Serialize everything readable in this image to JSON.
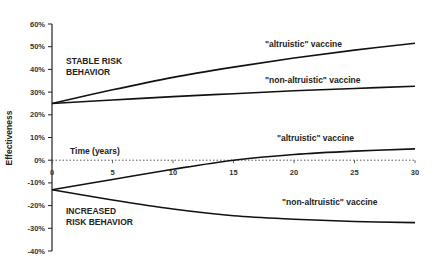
{
  "chart_data": {
    "type": "line",
    "title": "",
    "xlabel": "Time (years)",
    "ylabel": "Effectiveness",
    "xlim": [
      0,
      30
    ],
    "ylim": [
      -40,
      60
    ],
    "x_ticks": [
      "0",
      "5",
      "10",
      "15",
      "20",
      "25",
      "30"
    ],
    "y_ticks": [
      "60%",
      "50%",
      "40%",
      "30%",
      "20%",
      "10%",
      "0%",
      "-10%",
      "-20%",
      "-30%",
      "-40%"
    ],
    "grid": false,
    "x": [
      0,
      5,
      10,
      15,
      20,
      25,
      30
    ],
    "series": [
      {
        "name": "\"altruistic\" vaccine (stable risk behavior)",
        "values": [
          25,
          31,
          36.5,
          41,
          45,
          48.5,
          51.5
        ]
      },
      {
        "name": "\"non-altruistic\" vaccine (stable risk behavior)",
        "values": [
          25,
          26.5,
          28,
          29.3,
          30.6,
          31.6,
          32.6
        ]
      },
      {
        "name": "\"altruistic\" vaccine (increased risk behavior)",
        "values": [
          -13,
          -8.5,
          -4,
          0,
          2.5,
          4,
          5
        ]
      },
      {
        "name": "\"non-altruistic\" vaccine (increased risk behavior)",
        "values": [
          -13,
          -17.5,
          -21.5,
          -24.5,
          -26,
          -27,
          -27.5
        ]
      }
    ],
    "annotations": [
      "STABLE RISK BEHAVIOR",
      "INCREASED RISK BEHAVIOR",
      "\"altruistic\" vaccine",
      "\"non-altruistic\" vaccine",
      "\"altruistic\" vaccine",
      "\"non-altruistic\" vaccine"
    ],
    "reference_line": {
      "y": 0,
      "style": "dotted"
    }
  },
  "labels": {
    "ylabel": "Effectiveness",
    "xlabel": "Time (years)",
    "stable": [
      "STABLE RISK",
      "BEHAVIOR"
    ],
    "increased": [
      "INCREASED",
      "RISK BEHAVIOR"
    ],
    "alt_top": "\"altruistic\" vaccine",
    "nonalt_top": "\"non-altruistic\" vaccine",
    "alt_bottom": "\"altruistic\" vaccine",
    "nonalt_bottom": "\"non-altruistic\" vaccine"
  }
}
